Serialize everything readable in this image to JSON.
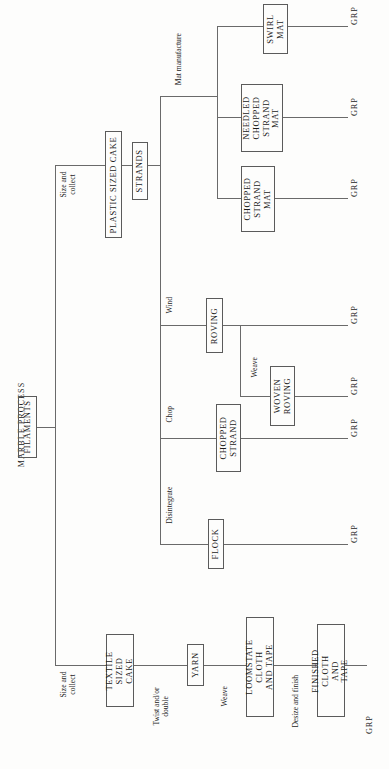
{
  "diagram": {
    "title": "MARBLE PROCESS",
    "type": "process-flowchart",
    "orientation": "rotated-90-ccw",
    "output_label": "GRP",
    "nodes": [
      {
        "id": "filaments",
        "label": "FILAMENTS"
      },
      {
        "id": "textile_sized_cake",
        "label": "TEXTILE SIZED\nCAKE"
      },
      {
        "id": "yarn",
        "label": "YARN"
      },
      {
        "id": "loomstate_cloth",
        "label": "LOOMSTATE CLOTH\nAND TAPE"
      },
      {
        "id": "finished_cloth",
        "label": "FINISHED CLOTH\nAND TAPE"
      },
      {
        "id": "plastic_sized_cake",
        "label": "PLASTIC SIZED CAKE"
      },
      {
        "id": "strands",
        "label": "STRANDS"
      },
      {
        "id": "flock",
        "label": "FLOCK"
      },
      {
        "id": "chopped_strand",
        "label": "CHOPPED\nSTRAND"
      },
      {
        "id": "roving",
        "label": "ROVING"
      },
      {
        "id": "woven_roving",
        "label": "WOVEN\nROVING"
      },
      {
        "id": "chopped_strand_mat",
        "label": "CHOPPED\nSTRAND\nMAT"
      },
      {
        "id": "needled_chopped_mat",
        "label": "NEEDLED\nCHOPPED\nSTRAND\nMAT"
      },
      {
        "id": "swirl_mat",
        "label": "SWIRL\nMAT"
      }
    ],
    "process_labels": [
      {
        "id": "size_collect_textile",
        "label": "Size and\ncollect"
      },
      {
        "id": "twist_double",
        "label": "Twist and/or\ndouble"
      },
      {
        "id": "weave_cloth",
        "label": "Weave"
      },
      {
        "id": "desize_finish",
        "label": "Desize and finish"
      },
      {
        "id": "size_collect_plastic",
        "label": "Size and\ncollect"
      },
      {
        "id": "disintegrate",
        "label": "Disintegrate"
      },
      {
        "id": "chop",
        "label": "Chop"
      },
      {
        "id": "wind",
        "label": "Wind"
      },
      {
        "id": "weave_roving",
        "label": "Weave"
      },
      {
        "id": "mat_manufacture",
        "label": "Mat manufacture"
      }
    ],
    "outputs": [
      {
        "id": "grp_swirl_mat",
        "label": "GRP"
      },
      {
        "id": "grp_needled_mat",
        "label": "GRP"
      },
      {
        "id": "grp_chopped_mat",
        "label": "GRP"
      },
      {
        "id": "grp_roving",
        "label": "GRP"
      },
      {
        "id": "grp_woven_roving",
        "label": "GRP"
      },
      {
        "id": "grp_chopped_strand",
        "label": "GRP"
      },
      {
        "id": "grp_flock",
        "label": "GRP"
      },
      {
        "id": "grp_finished_cloth",
        "label": "GRP"
      }
    ],
    "colors": {
      "line": "#6a6a6a",
      "box_border": "#5b5b5b",
      "text": "#1a1a1a",
      "background": "#fdfdfc"
    }
  }
}
